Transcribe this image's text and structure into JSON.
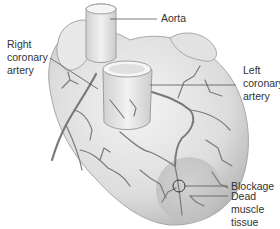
{
  "diagram": {
    "type": "anatomical-illustration",
    "colors": {
      "heart_fill": "#e6e6e6",
      "heart_shadow": "#b8b8b8",
      "vessel": "#7a7a7a",
      "dead_tissue": "#c8c8c8",
      "leader_line": "#555555",
      "text": "#333333"
    },
    "labels": {
      "aorta": [
        "Aorta"
      ],
      "right_coronary_artery": [
        "Right",
        "coronary",
        "artery"
      ],
      "left_coronary_artery": [
        "Left",
        "coronary",
        "artery"
      ],
      "blockage": [
        "Blockage"
      ],
      "dead_muscle_tissue": [
        "Dead",
        "muscle",
        "tissue"
      ]
    }
  }
}
